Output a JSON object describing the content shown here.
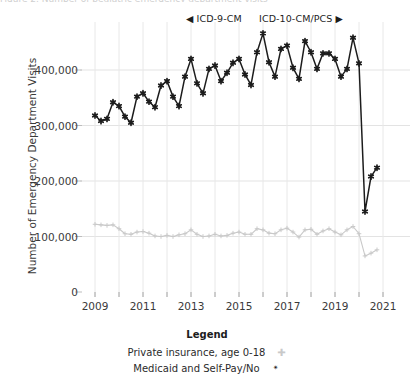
{
  "title_clipped": "Figure 2. Number of pediatric emergency department visits",
  "axes": {
    "ylabel": "Number of Emergency Department Visits",
    "yticks": [
      "0",
      "100,000",
      "200,000",
      "300,000",
      "400,000"
    ],
    "ytick_values": [
      0,
      100000,
      200000,
      300000,
      400000
    ],
    "xticks": [
      "2009",
      "2011",
      "2013",
      "2015",
      "2017",
      "2019",
      "2021"
    ],
    "xtick_values": [
      2009,
      2011,
      2013,
      2015,
      2017,
      2019,
      2021
    ]
  },
  "annotations": {
    "icd9_label": "◀ ICD-9-CM",
    "icd10_label": "ICD-10-CM/PCS ▶"
  },
  "legend": {
    "title": "Legend",
    "items": [
      {
        "label": "Private insurance, age 0-18",
        "marker": "✚",
        "color": "#c9c9c9"
      },
      {
        "label": "Medicaid and Self-Pay/No",
        "marker": "✴",
        "color": "#1c1c1c"
      }
    ]
  },
  "chart_data": {
    "type": "line",
    "xlabel": "",
    "ylabel": "Number of Emergency Department Visits",
    "xlim": [
      2008.9,
      2021.4
    ],
    "ylim": [
      0,
      480000
    ],
    "grid": true,
    "legend_position": "bottom",
    "x": [
      2009.0,
      2009.25,
      2009.5,
      2009.75,
      2010.0,
      2010.25,
      2010.5,
      2010.75,
      2011.0,
      2011.25,
      2011.5,
      2011.75,
      2012.0,
      2012.25,
      2012.5,
      2012.75,
      2013.0,
      2013.25,
      2013.5,
      2013.75,
      2014.0,
      2014.25,
      2014.5,
      2014.75,
      2015.0,
      2015.25,
      2015.5,
      2015.75,
      2016.0,
      2016.25,
      2016.5,
      2016.75,
      2017.0,
      2017.25,
      2017.5,
      2017.75,
      2018.0,
      2018.25,
      2018.5,
      2018.75,
      2019.0,
      2019.25,
      2019.5,
      2019.75,
      2020.0,
      2020.25,
      2020.5,
      2020.75
    ],
    "series": [
      {
        "name": "Medicaid and Self-Pay/No",
        "color": "#1c1c1c",
        "marker": "star",
        "values": [
          318000,
          308000,
          312000,
          342000,
          335000,
          316000,
          305000,
          352000,
          358000,
          343000,
          333000,
          372000,
          380000,
          352000,
          335000,
          388000,
          420000,
          376000,
          358000,
          402000,
          408000,
          380000,
          395000,
          413000,
          420000,
          392000,
          373000,
          432000,
          466000,
          414000,
          388000,
          438000,
          444000,
          404000,
          384000,
          452000,
          432000,
          402000,
          430000,
          430000,
          420000,
          388000,
          402000,
          458000,
          412000,
          145000,
          208000,
          224000
        ]
      },
      {
        "name": "Private insurance, age 0-18",
        "color": "#c9c9c9",
        "marker": "plus",
        "values": [
          122000,
          121000,
          120000,
          121000,
          114000,
          105000,
          104000,
          108000,
          109000,
          106000,
          101000,
          100000,
          102000,
          100000,
          103000,
          105000,
          112000,
          104000,
          100000,
          101000,
          104000,
          101000,
          102000,
          106000,
          108000,
          104000,
          104000,
          114000,
          112000,
          106000,
          105000,
          112000,
          115000,
          108000,
          99000,
          112000,
          113000,
          104000,
          110000,
          114000,
          108000,
          103000,
          112000,
          118000,
          105000,
          65000,
          70000,
          76000
        ]
      }
    ]
  }
}
